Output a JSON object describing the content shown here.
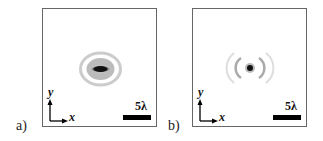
{
  "panels": [
    {
      "label": "a)",
      "pattern": "elongated-horizontal-spot",
      "scale_bar": "5λ",
      "axes": {
        "x": "x",
        "y": "y"
      }
    },
    {
      "label": "b)",
      "pattern": "round-spot-with-rings",
      "scale_bar": "5λ",
      "axes": {
        "x": "x",
        "y": "y"
      }
    }
  ]
}
